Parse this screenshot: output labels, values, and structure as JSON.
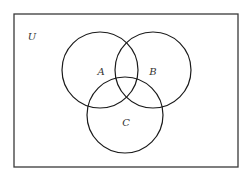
{
  "diagram": {
    "type": "venn",
    "universe": {
      "label": "U",
      "rect": {
        "x": 14,
        "y": 14,
        "width": 224,
        "height": 153
      },
      "label_pos": {
        "x": 32,
        "y": 40
      }
    },
    "sets": [
      {
        "id": "A",
        "label": "A",
        "cx": 100,
        "cy": 70,
        "r": 38,
        "label_pos": {
          "x": 101,
          "y": 75
        }
      },
      {
        "id": "B",
        "label": "B",
        "cx": 153,
        "cy": 70,
        "r": 38,
        "label_pos": {
          "x": 153,
          "y": 75
        }
      },
      {
        "id": "C",
        "label": "C",
        "cx": 125,
        "cy": 115,
        "r": 38,
        "label_pos": {
          "x": 126,
          "y": 126
        }
      }
    ],
    "colors": {
      "stroke": "#1a1a1a",
      "background": "#ffffff",
      "label": "#333333"
    }
  }
}
